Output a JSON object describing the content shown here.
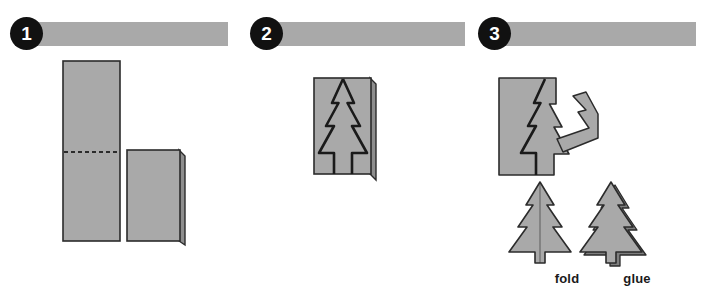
{
  "document": {
    "title": "Paper Christmas Tree Craft Instructions",
    "background_color": "#ffffff"
  },
  "colors": {
    "paper_gray": "#a9a9a9",
    "paper_shadow": "#8e8e8e",
    "outline_dark": "#2b2b2b",
    "badge_black": "#111111",
    "badge_text": "#ffffff",
    "caption_text": "#1a1a1a"
  },
  "panels": [
    {
      "number": "1",
      "bar_label": "",
      "description": "Rectangular sheet of paper with a dashed fold line, shown folded in half",
      "shapes": [
        "full-sheet",
        "fold-dashed-line",
        "folded-sheet"
      ]
    },
    {
      "number": "2",
      "bar_label": "",
      "description": "Half of a tree drawn on the folded paper along the fold edge",
      "shapes": [
        "folded-sheet",
        "tree-outline"
      ]
    },
    {
      "number": "3",
      "bar_label": "",
      "description": "Tree cut out, scrap removed, two finished trees",
      "shapes": [
        "cut-sheet",
        "scrap-piece",
        "tree-fold",
        "tree-glue"
      ]
    }
  ],
  "captions": {
    "fold": "fold",
    "glue": "glue"
  }
}
